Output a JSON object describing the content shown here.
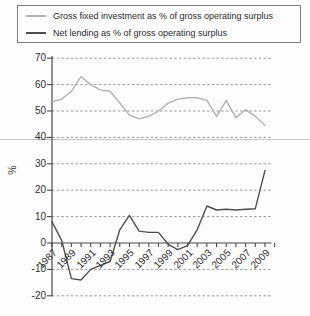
{
  "legend": {
    "items": [
      {
        "label": "Gross fixed investment as % of gross operating surplus",
        "color": "#b2b2b2"
      },
      {
        "label": "Net lending as % of gross operating surplus",
        "color": "#4f4f4f"
      }
    ]
  },
  "chart_data": {
    "type": "line",
    "title": "",
    "xlabel": "",
    "ylabel": "%",
    "ylim": [
      -20,
      70
    ],
    "ytick_step": 10,
    "grid": "dashed horizontal gridlines",
    "legend_position": "top-left boxed",
    "x": [
      1987,
      1988,
      1989,
      1990,
      1991,
      1992,
      1993,
      1994,
      1995,
      1996,
      1997,
      1998,
      1999,
      2000,
      2001,
      2002,
      2003,
      2004,
      2005,
      2006,
      2007,
      2008,
      2009
    ],
    "xtick_labels": [
      "1987",
      "1989",
      "1991",
      "1993",
      "1995",
      "1997",
      "1999",
      "2001",
      "2003",
      "2005",
      "2007",
      "2009"
    ],
    "xtick_minor_every_year": true,
    "xaxis_extra_tick_year": 2010,
    "series": [
      {
        "name": "Gross fixed investment as % of gross operating surplus",
        "color": "#b2b2b2",
        "values": [
          53.5,
          54.5,
          57.5,
          63,
          60,
          58,
          57.5,
          53,
          48.5,
          47,
          48,
          50,
          53,
          54.5,
          55,
          55,
          54,
          48,
          54,
          47.5,
          50.5,
          48,
          44.5
        ]
      },
      {
        "name": "Net lending as % of gross operating surplus",
        "color": "#4f4f4f",
        "values": [
          8,
          1,
          -13.5,
          -14,
          -10,
          -8.5,
          -7,
          5,
          10.5,
          4.5,
          4,
          4,
          -0.5,
          -2.5,
          -1,
          5,
          14,
          12.5,
          12.8,
          12.5,
          12.8,
          13,
          27.5
        ]
      }
    ],
    "ytick_labels": [
      "70",
      "60",
      "50",
      "40",
      "30",
      "20",
      "10",
      "0",
      "-10",
      "-20"
    ]
  },
  "decor": {
    "page_rule_color": "#c8c8c8",
    "axis_color": "#4a4a4a",
    "grid_color": "#999999",
    "text_color": "#2e2e2e"
  }
}
